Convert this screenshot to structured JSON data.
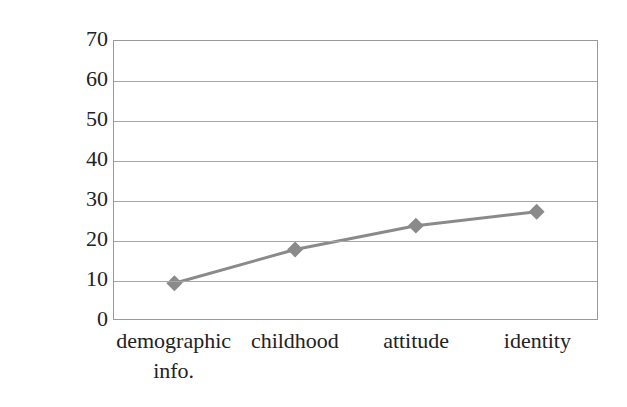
{
  "chart_data": {
    "type": "line",
    "title": "",
    "subtitle": "",
    "xlabel": "",
    "ylabel": "タ行子音有声化割合(%)",
    "categories": [
      "demographic info.",
      "childhood",
      "attitude",
      "identity"
    ],
    "category_lines": [
      [
        "demographic",
        "info."
      ],
      [
        "childhood"
      ],
      [
        "attitude"
      ],
      [
        "identity"
      ]
    ],
    "values": [
      9,
      17.5,
      23.5,
      27
    ],
    "series": [
      {
        "name": "タ行子音有声化割合",
        "values": [
          9,
          17.5,
          23.5,
          27
        ]
      }
    ],
    "ylim": [
      0,
      70
    ],
    "ytick_labels": [
      "70",
      "60",
      "50",
      "40",
      "30",
      "20",
      "10",
      "0"
    ],
    "ytick_values": [
      70,
      60,
      50,
      40,
      30,
      20,
      10,
      0
    ],
    "ytick_step": 10,
    "grid": "horizontal",
    "legend": "none",
    "marker": "diamond",
    "series_color": "#8a8a8a",
    "grid_color": "#a6a6a6",
    "axis_color": "#9a9a9a",
    "text_color": "#222222",
    "background": "#ffffff"
  }
}
